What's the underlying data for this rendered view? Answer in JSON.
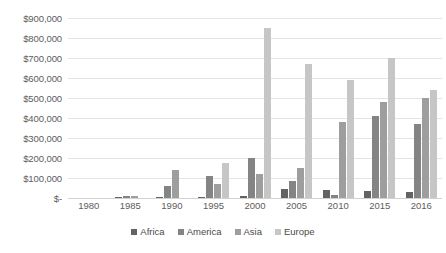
{
  "chart_data": {
    "type": "bar",
    "title": "",
    "xlabel": "",
    "ylabel": "",
    "categories": [
      "1980",
      "1985",
      "1990",
      "1995",
      "2000",
      "2005",
      "2010",
      "2015",
      "2016"
    ],
    "ylim": [
      0,
      900000
    ],
    "ytick_step": 100000,
    "ytick_labels": [
      "$900,000",
      "$800,000",
      "$700,000",
      "$600,000",
      "$500,000",
      "$400,000",
      "$300,000",
      "$200,000",
      "$100,000",
      "$-"
    ],
    "ytick_values": [
      900000,
      800000,
      700000,
      600000,
      500000,
      400000,
      300000,
      200000,
      100000,
      0
    ],
    "grid": true,
    "legend_position": "bottom",
    "series": [
      {
        "name": "Africa",
        "color": "#636363",
        "values": [
          0,
          3000,
          5000,
          6000,
          8000,
          45000,
          40000,
          35000,
          30000
        ]
      },
      {
        "name": "America",
        "color": "#848484",
        "values": [
          0,
          8000,
          60000,
          110000,
          200000,
          85000,
          15000,
          410000,
          370000
        ]
      },
      {
        "name": "Asia",
        "color": "#9e9e9e",
        "values": [
          0,
          10000,
          140000,
          70000,
          120000,
          150000,
          380000,
          480000,
          500000
        ]
      },
      {
        "name": "Europe",
        "color": "#c6c6c6",
        "values": [
          0,
          0,
          0,
          175000,
          850000,
          670000,
          590000,
          700000,
          540000
        ]
      }
    ]
  }
}
